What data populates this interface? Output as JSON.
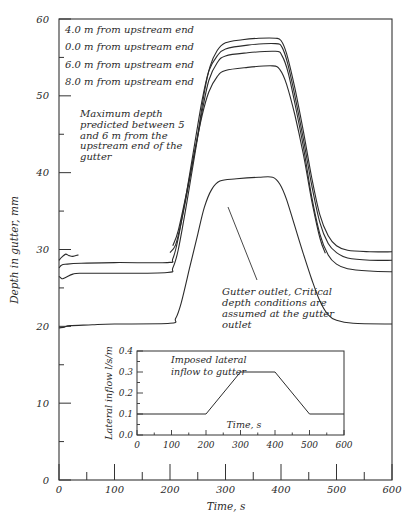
{
  "chart_data": [
    {
      "type": "line",
      "title": "",
      "xlabel": "Time, s",
      "ylabel": "Depth in gutter, mm",
      "xlim": [
        0,
        600
      ],
      "ylim": [
        0,
        60
      ],
      "x_ticks": [
        0,
        100,
        200,
        300,
        400,
        500,
        600
      ],
      "x_minor_ticks": [
        50,
        150,
        250,
        350,
        450,
        550
      ],
      "y_ticks": [
        0,
        10,
        20,
        30,
        40,
        50,
        60
      ],
      "y_minor_ticks": [
        5,
        15,
        25,
        35,
        45,
        55
      ],
      "grid": false,
      "legend_position": "top-left (text list)",
      "series": [
        {
          "name": "4.0 m from upstream end",
          "points": [
            [
              200,
              29.6
            ],
            [
              210,
              30.6
            ],
            [
              220,
              33.5
            ],
            [
              235,
              39
            ],
            [
              250,
              45
            ],
            [
              262,
              50.5
            ],
            [
              272,
              53.8
            ],
            [
              285,
              55.9
            ],
            [
              300,
              56.9
            ],
            [
              330,
              57.3
            ],
            [
              360,
              57.5
            ],
            [
              390,
              57.5
            ],
            [
              400,
              57.2
            ],
            [
              410,
              55.5
            ],
            [
              425,
              51
            ],
            [
              440,
              45.5
            ],
            [
              455,
              39.5
            ],
            [
              470,
              34.5
            ],
            [
              485,
              31.8
            ],
            [
              500,
              30.5
            ],
            [
              520,
              29.9
            ],
            [
              560,
              29.7
            ],
            [
              600,
              29.7
            ]
          ]
        },
        {
          "name": "0.0 m from upstream end",
          "points": [
            [
              0,
              27.6
            ],
            [
              5,
              28.0
            ],
            [
              15,
              28.1
            ],
            [
              40,
              28.2
            ],
            [
              100,
              28.3
            ],
            [
              195,
              28.3
            ],
            [
              205,
              28.8
            ],
            [
              215,
              31.5
            ],
            [
              230,
              37.5
            ],
            [
              245,
              44
            ],
            [
              258,
              49.5
            ],
            [
              270,
              53.2
            ],
            [
              285,
              55.2
            ],
            [
              300,
              56.1
            ],
            [
              340,
              56.6
            ],
            [
              390,
              56.8
            ],
            [
              402,
              56.3
            ],
            [
              412,
              54.2
            ],
            [
              425,
              50
            ],
            [
              440,
              44.5
            ],
            [
              455,
              38.5
            ],
            [
              470,
              33.5
            ],
            [
              485,
              30.8
            ],
            [
              500,
              29.6
            ],
            [
              520,
              28.9
            ],
            [
              560,
              28.6
            ],
            [
              600,
              28.6
            ]
          ]
        },
        {
          "name": "6.0 m from upstream end",
          "points": [
            [
              0,
              26.5
            ],
            [
              5,
              26.2
            ],
            [
              10,
              26.3
            ],
            [
              25,
              26.8
            ],
            [
              40,
              26.9
            ],
            [
              100,
              26.9
            ],
            [
              195,
              27.0
            ],
            [
              205,
              27.6
            ],
            [
              215,
              30
            ],
            [
              230,
              36
            ],
            [
              245,
              42.5
            ],
            [
              258,
              48
            ],
            [
              270,
              52
            ],
            [
              285,
              54.3
            ],
            [
              300,
              55.2
            ],
            [
              340,
              55.6
            ],
            [
              390,
              55.8
            ],
            [
              402,
              55.2
            ],
            [
              413,
              53
            ],
            [
              425,
              49
            ],
            [
              440,
              43.5
            ],
            [
              455,
              37
            ],
            [
              470,
              32
            ],
            [
              485,
              29.3
            ],
            [
              500,
              28.1
            ],
            [
              520,
              27.5
            ],
            [
              560,
              27.2
            ],
            [
              600,
              27.1
            ]
          ]
        },
        {
          "name": "8.0 m from upstream end",
          "points": [
            [
              205,
              30.5
            ],
            [
              215,
              32.5
            ],
            [
              230,
              37.5
            ],
            [
              245,
              43
            ],
            [
              258,
              47.5
            ],
            [
              270,
              50.5
            ],
            [
              285,
              52.5
            ],
            [
              300,
              53.3
            ],
            [
              340,
              53.7
            ],
            [
              385,
              53.9
            ],
            [
              398,
              53.4
            ],
            [
              410,
              51.5
            ],
            [
              425,
              47.5
            ],
            [
              440,
              42.5
            ],
            [
              455,
              36.5
            ],
            [
              470,
              31.5
            ],
            [
              480,
              29.5
            ]
          ]
        },
        {
          "name": "Gutter outlet",
          "points": [
            [
              0,
              19.8
            ],
            [
              10,
              19.9
            ],
            [
              20,
              20.1
            ],
            [
              60,
              20.2
            ],
            [
              100,
              20.3
            ],
            [
              200,
              20.4
            ],
            [
              210,
              21
            ],
            [
              220,
              23
            ],
            [
              235,
              27.5
            ],
            [
              250,
              32
            ],
            [
              262,
              35.5
            ],
            [
              275,
              37.8
            ],
            [
              290,
              38.9
            ],
            [
              320,
              39.2
            ],
            [
              360,
              39.4
            ],
            [
              385,
              39.4
            ],
            [
              398,
              38.5
            ],
            [
              410,
              36.5
            ],
            [
              425,
              33
            ],
            [
              440,
              29.5
            ],
            [
              455,
              26.2
            ],
            [
              470,
              23.3
            ],
            [
              485,
              21.5
            ],
            [
              500,
              20.8
            ],
            [
              530,
              20.4
            ],
            [
              600,
              20.3
            ]
          ]
        },
        {
          "name": "Initial transient (upstream)",
          "points": [
            [
              0,
              28.6
            ],
            [
              5,
              29.0
            ],
            [
              12,
              29.4
            ],
            [
              18,
              29.2
            ],
            [
              25,
              29.1
            ],
            [
              35,
              29.3
            ]
          ]
        }
      ],
      "annotations": [
        "Maximum depth predicted between 5 and 6 m from the upstream end of the gutter",
        "Gutter outlet, Critical depth conditions are assumed at the gutter outlet"
      ]
    },
    {
      "type": "line",
      "title": "Imposed lateral inflow to gutter",
      "xlabel": "Time, s",
      "ylabel": "Lateral inflow l/s/m",
      "xlim": [
        0,
        600
      ],
      "ylim": [
        0,
        0.4
      ],
      "x_ticks": [
        0,
        100,
        200,
        300,
        400,
        500,
        600
      ],
      "y_ticks": [
        0.0,
        0.1,
        0.2,
        0.3,
        0.4
      ],
      "grid": false,
      "series": [
        {
          "name": "Imposed lateral inflow",
          "points": [
            [
              0,
              0.1
            ],
            [
              200,
              0.1
            ],
            [
              300,
              0.3
            ],
            [
              400,
              0.3
            ],
            [
              500,
              0.1
            ],
            [
              600,
              0.1
            ]
          ]
        }
      ]
    }
  ],
  "main": {
    "xlabel": "Time, s",
    "ylabel": "Depth in gutter, mm",
    "x_tick_labels": [
      "0",
      "100",
      "200",
      "300",
      "400",
      "500",
      "600"
    ],
    "y_tick_labels": [
      "0",
      "10",
      "20",
      "30",
      "40",
      "50",
      "60"
    ],
    "legend": [
      "4.0 m from upstream end",
      "0.0 m from upstream end",
      "6.0 m from upstream end",
      "8.0 m from upstream end"
    ],
    "annotation_max": [
      "Maximum depth",
      "predicted between 5",
      "and 6 m from the",
      "upstream end of the",
      "gutter"
    ],
    "annotation_outlet": [
      "Gutter outlet, Critical",
      "depth conditions are",
      "assumed at the gutter",
      "outlet"
    ]
  },
  "inset": {
    "title_lines": [
      "Imposed lateral",
      "inflow to gutter"
    ],
    "xlabel": "Time, s",
    "ylabel": "Lateral inflow l/s/m",
    "x_tick_labels": [
      "0",
      "100",
      "200",
      "300",
      "400",
      "500",
      "600"
    ],
    "y_tick_labels": [
      "0.0",
      "0.1",
      "0.2",
      "0.3",
      "0.4"
    ]
  },
  "colors": {
    "line": "#2b2b2b",
    "axis": "#333333",
    "text": "#2a2a2a",
    "background": "#ffffff"
  }
}
